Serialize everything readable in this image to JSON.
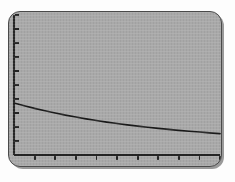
{
  "screen": {
    "device": "graphing-calculator-lcd",
    "background_color": "#a9a9a9",
    "border_color": "#4a4a4a",
    "outside_color": "#fdfdfd"
  },
  "chart_data": {
    "type": "line",
    "title": "",
    "subtitle": "",
    "xlabel": "",
    "ylabel": "",
    "legend": [],
    "annotations": [],
    "grid": false,
    "axis_color": "#252525",
    "curve_color": "#1a1a1a",
    "curve_width": 1.6,
    "xlim": [
      0,
      10
    ],
    "ylim": [
      0,
      10
    ],
    "xticks": [
      1,
      2,
      3,
      4,
      5,
      6,
      7,
      8,
      9,
      10
    ],
    "yticks": [
      1,
      2,
      3,
      4,
      5,
      6,
      7,
      8,
      9,
      10
    ],
    "xticklabels": [],
    "yticklabels": [],
    "tick_direction_x": "out",
    "tick_direction_y": "in",
    "series": [
      {
        "name": "decay-curve",
        "x": [
          0.0,
          0.5,
          1.0,
          1.5,
          2.0,
          2.5,
          3.0,
          3.5,
          4.0,
          4.5,
          5.0,
          5.5,
          6.0,
          6.5,
          7.0,
          7.5,
          8.0,
          8.5,
          9.0,
          9.5,
          10.0
        ],
        "y": [
          3.72,
          3.52,
          3.33,
          3.16,
          3.0,
          2.85,
          2.71,
          2.58,
          2.46,
          2.35,
          2.25,
          2.15,
          2.06,
          1.98,
          1.9,
          1.83,
          1.76,
          1.7,
          1.64,
          1.58,
          1.53
        ]
      }
    ]
  }
}
